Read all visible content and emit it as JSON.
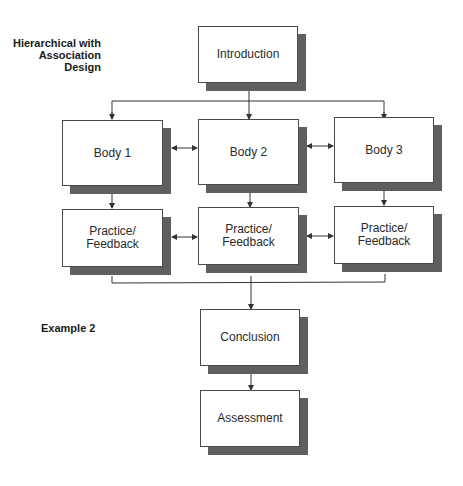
{
  "title": "Hierarchical with Association Design",
  "title_lines": [
    "Hierarchical with",
    "Association Design"
  ],
  "example_label": "Example 2",
  "nodes": {
    "introduction": {
      "label": "Introduction"
    },
    "body1": {
      "label": "Body 1"
    },
    "body2": {
      "label": "Body 2"
    },
    "body3": {
      "label": "Body 3"
    },
    "practice1": {
      "label_lines": [
        "Practice/",
        "Feedback"
      ]
    },
    "practice2": {
      "label_lines": [
        "Practice/",
        "Feedback"
      ]
    },
    "practice3": {
      "label_lines": [
        "Practice/",
        "Feedback"
      ]
    },
    "conclusion": {
      "label": "Conclusion"
    },
    "assessment": {
      "label": "Assessment"
    }
  },
  "edges": [
    {
      "from": "introduction",
      "to": "body1",
      "type": "arrow"
    },
    {
      "from": "introduction",
      "to": "body2",
      "type": "arrow"
    },
    {
      "from": "introduction",
      "to": "body3",
      "type": "arrow"
    },
    {
      "from": "body1",
      "to": "body2",
      "type": "bidirectional"
    },
    {
      "from": "body2",
      "to": "body3",
      "type": "bidirectional"
    },
    {
      "from": "body1",
      "to": "practice1",
      "type": "arrow"
    },
    {
      "from": "body2",
      "to": "practice2",
      "type": "arrow"
    },
    {
      "from": "body3",
      "to": "practice3",
      "type": "arrow"
    },
    {
      "from": "practice1",
      "to": "practice2",
      "type": "bidirectional"
    },
    {
      "from": "practice2",
      "to": "practice3",
      "type": "bidirectional"
    },
    {
      "from": "practice1",
      "to": "conclusion",
      "type": "arrow"
    },
    {
      "from": "practice2",
      "to": "conclusion",
      "type": "arrow"
    },
    {
      "from": "practice3",
      "to": "conclusion",
      "type": "arrow"
    },
    {
      "from": "conclusion",
      "to": "assessment",
      "type": "arrow"
    }
  ],
  "colors": {
    "shadow": "#5f5f5f",
    "border": "#4a4a4a",
    "line": "#333333",
    "background": "#ffffff"
  }
}
